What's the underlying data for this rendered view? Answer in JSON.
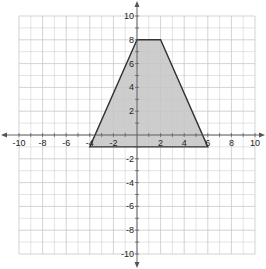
{
  "graph": {
    "x_range": [
      -10,
      10
    ],
    "y_range": [
      -10,
      10
    ],
    "grid_step": 1,
    "label_step": 2,
    "x_tick_labels": [
      "-10",
      "-8",
      "-6",
      "-4",
      "-2",
      "2",
      "4",
      "6",
      "8",
      "10"
    ],
    "y_tick_labels": [
      "10",
      "8",
      "6",
      "4",
      "2",
      "-2",
      "-4",
      "-6",
      "-8",
      "-10"
    ],
    "colors": {
      "grid": "#c8c8c8",
      "axis": "#555555",
      "fill": "#c4c4c4",
      "stroke": "#333333"
    }
  },
  "chart_data": {
    "type": "diagram",
    "title": "",
    "xlim": [
      -10,
      10
    ],
    "ylim": [
      -10,
      10
    ],
    "grid": true,
    "shape": "trapezoid",
    "vertices": [
      [
        -4,
        -1
      ],
      [
        6,
        -1
      ],
      [
        2,
        8
      ],
      [
        0,
        8
      ]
    ],
    "fill": "shaded gray"
  }
}
